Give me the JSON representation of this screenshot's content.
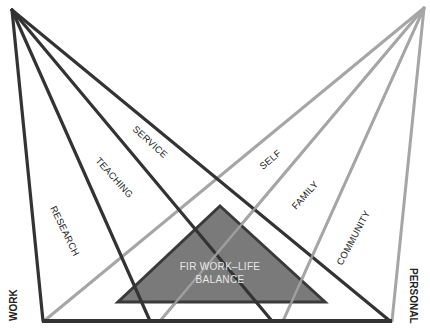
{
  "diagram": {
    "colors": {
      "work_lines": "#333333",
      "personal_lines": "#a6a6a6",
      "center_fill": "#7a7a7a",
      "center_stroke": "#3a3a3a",
      "center_text": "#eeeeee"
    },
    "axes": {
      "left": "WORK",
      "right": "PERSONAL"
    },
    "work_domains": [
      "RESEARCH",
      "TEACHING",
      "SERVICE"
    ],
    "personal_domains": [
      "SELF",
      "FAMILY",
      "COMMUNITY"
    ],
    "center": {
      "line1": "FIR WORK–LIFE",
      "line2": "BALANCE"
    }
  }
}
